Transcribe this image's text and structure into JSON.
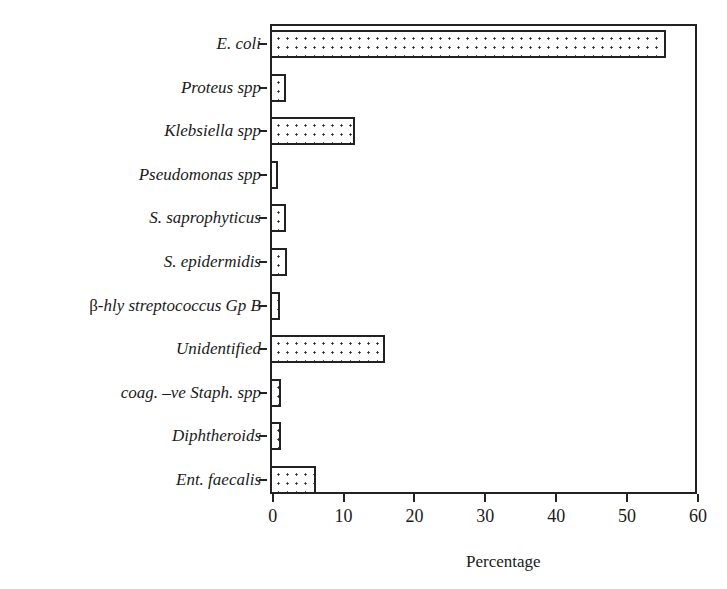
{
  "chart_data": {
    "type": "bar",
    "orientation": "horizontal",
    "title": "",
    "xlabel": "Percentage",
    "ylabel": "",
    "xlim": [
      0,
      60
    ],
    "xticks": [
      "0",
      "10",
      "20",
      "30",
      "40",
      "50",
      "60"
    ],
    "grid": false,
    "legend": null,
    "pattern": "dotted",
    "categories": [
      "E. coli",
      "Proteus spp",
      "Klebsiella spp",
      "Pseudomonas spp",
      "S. saprophyticus",
      "S. epidermidis",
      "β-hly streptococcus Gp B",
      "Unidentified",
      "coag. –ve Staph. spp",
      "Diphtheroids",
      "Ent. faecalis"
    ],
    "values": [
      55.5,
      1.8,
      11.5,
      0.7,
      1.9,
      2.0,
      1.0,
      15.8,
      1.1,
      1.1,
      6.1
    ]
  }
}
